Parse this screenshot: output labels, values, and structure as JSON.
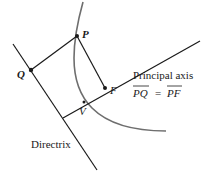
{
  "diagram": {
    "colors": {
      "line": "#1a1a1a",
      "curve": "#6e6e6e",
      "background": "#ffffff"
    },
    "points": {
      "P": {
        "label": "P",
        "x": 77,
        "y": 36
      },
      "Q": {
        "label": "Q",
        "x": 31,
        "y": 70
      },
      "F": {
        "label": "F",
        "x": 105,
        "y": 88
      },
      "V": {
        "label": "V",
        "x": 84,
        "y": 102
      }
    },
    "labels": {
      "principal_axis": "Principal axis",
      "directrix": "Directrix",
      "equation_lhs": "PQ",
      "equation_eq": "=",
      "equation_rhs": "PF"
    }
  }
}
